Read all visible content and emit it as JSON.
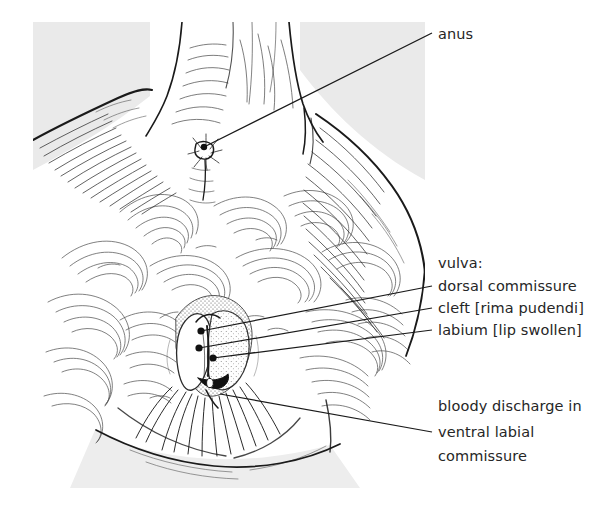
{
  "figure": {
    "kind": "anatomical-line-drawing",
    "panel_bg_color": "#e9e9e9",
    "ink_color": "#1a1a1a",
    "text_color": "#262626",
    "background_color": "#ffffff"
  },
  "labels": {
    "anus": "anus",
    "vulva_heading": "vulva:",
    "dorsal_commissure": "dorsal commissure",
    "cleft": "cleft [rima pudendi]",
    "labium": "labium [lip swollen]",
    "discharge_line1": "bloody discharge in",
    "discharge_line2": "ventral labial",
    "discharge_line3": "commissure"
  },
  "leaders": [
    {
      "name": "anus",
      "from_x": 204,
      "from_y": 147,
      "to_x": 432,
      "to_y": 33,
      "dot": true
    },
    {
      "name": "dorsal-commissure",
      "from_x": 201,
      "from_y": 331,
      "to_x": 432,
      "to_y": 286,
      "dot": true
    },
    {
      "name": "cleft",
      "from_x": 199,
      "from_y": 348,
      "to_x": 432,
      "to_y": 308,
      "dot": true
    },
    {
      "name": "labium",
      "from_x": 213,
      "from_y": 358,
      "to_x": 432,
      "to_y": 330,
      "dot": true
    },
    {
      "name": "ventral-commissure",
      "from_x": 220,
      "from_y": 394,
      "to_x": 432,
      "to_y": 432,
      "dot": false
    }
  ],
  "label_positions": {
    "anus": {
      "x": 438,
      "y": 39
    },
    "vulva_heading": {
      "x": 438,
      "y": 268
    },
    "dorsal_commissure": {
      "x": 438,
      "y": 291
    },
    "cleft": {
      "x": 438,
      "y": 313
    },
    "labium": {
      "x": 438,
      "y": 335
    },
    "discharge_line1": {
      "x": 438,
      "y": 411
    },
    "discharge_line2": {
      "x": 438,
      "y": 437
    },
    "discharge_line3": {
      "x": 438,
      "y": 461
    }
  }
}
